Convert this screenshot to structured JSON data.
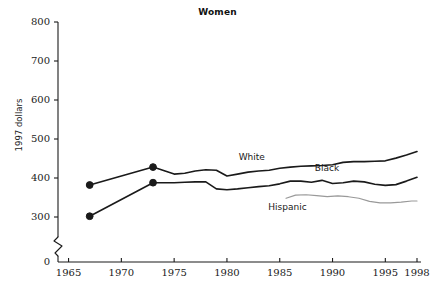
{
  "chart_data": {
    "type": "line",
    "title": "Women",
    "xlabel": "",
    "ylabel": "1997 dollars",
    "xlim": [
      1964,
      1998
    ],
    "ylim": [
      0,
      800
    ],
    "y_axis_break": true,
    "y_break_between": [
      0,
      270
    ],
    "grid": false,
    "legend": "inline-labels",
    "xticks": [
      1965,
      1970,
      1975,
      1980,
      1985,
      1990,
      1995,
      1998
    ],
    "xtick_labels": [
      "1965",
      "1970",
      "1975",
      "1980",
      "1985",
      "1990",
      "1995",
      "1998"
    ],
    "yticks": [
      0,
      300,
      400,
      500,
      600,
      700,
      800
    ],
    "ytick_labels": [
      "0",
      "300",
      "400",
      "500",
      "600",
      "700",
      "800"
    ],
    "series": [
      {
        "name": "White",
        "color": "#1a1a1a",
        "label_x": 1983.2,
        "label_y": 452,
        "x": [
          1967,
          1973,
          1975,
          1976,
          1977,
          1978,
          1979,
          1980,
          1981,
          1982,
          1983,
          1984,
          1985,
          1986,
          1987,
          1988,
          1989,
          1990,
          1991,
          1992,
          1993,
          1994,
          1995,
          1996,
          1997,
          1998
        ],
        "values": [
          382,
          428,
          410,
          412,
          418,
          421,
          420,
          405,
          410,
          415,
          418,
          420,
          425,
          428,
          430,
          431,
          432,
          434,
          440,
          442,
          442,
          443,
          444,
          451,
          459,
          468
        ],
        "markers_x": [
          1967,
          1973
        ],
        "markers_y": [
          382,
          428
        ]
      },
      {
        "name": "Black",
        "color": "#1a1a1a",
        "label_x": 1990.4,
        "label_y": 422,
        "x": [
          1967,
          1973,
          1975,
          1976,
          1977,
          1978,
          1979,
          1980,
          1981,
          1982,
          1983,
          1984,
          1985,
          1986,
          1987,
          1988,
          1989,
          1990,
          1991,
          1992,
          1993,
          1994,
          1995,
          1996,
          1997,
          1998
        ],
        "values": [
          302,
          388,
          388,
          389,
          390,
          390,
          372,
          370,
          372,
          375,
          378,
          380,
          385,
          392,
          392,
          389,
          394,
          386,
          388,
          392,
          390,
          384,
          381,
          383,
          392,
          402
        ],
        "markers_x": [
          1967,
          1973
        ],
        "markers_y": [
          302,
          388
        ]
      },
      {
        "name": "Hispanic",
        "color": "#999999",
        "label_x": 1986.0,
        "label_y": 322,
        "x": [
          1985.6,
          1986.5,
          1987.5,
          1988.5,
          1989.5,
          1990.5,
          1991.5,
          1992.5,
          1993.5,
          1994.5,
          1995.5,
          1996.5,
          1997.5,
          1998
        ],
        "values": [
          348,
          356,
          357,
          355,
          352,
          354,
          352,
          348,
          340,
          336,
          336,
          338,
          341,
          341
        ]
      }
    ]
  }
}
